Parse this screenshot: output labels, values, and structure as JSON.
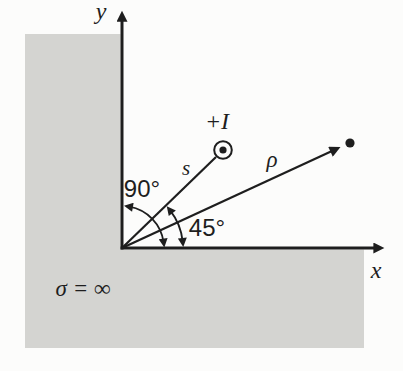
{
  "figure": {
    "axes": {
      "y_label": "y",
      "x_label": "x"
    },
    "source": {
      "label": "+I",
      "icon": "circled-dot-current-out-of-page"
    },
    "vectors": {
      "s_label": "s",
      "rho_label": "ρ"
    },
    "angles": {
      "corner_angle": "90°",
      "source_angle": "45°"
    },
    "conductor": {
      "conductivity_label": "σ = ∞"
    },
    "colors": {
      "ink": "#1e1e1e",
      "conductor_fill": "#d4d4d1",
      "background": "#fcfcfb"
    }
  }
}
